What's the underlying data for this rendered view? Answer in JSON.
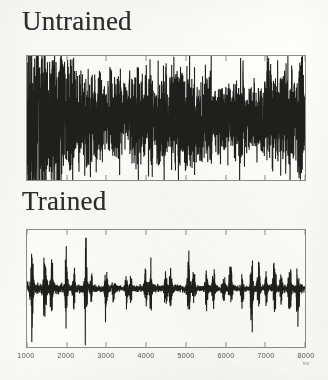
{
  "figure": {
    "background_color": "#fdfdfc",
    "trace_color": "#1f1f1d",
    "axis_color": "#8d8d8a"
  },
  "panels": [
    {
      "key": "untrained",
      "title": "Untrained",
      "description": "dense continuous high-amplitude activity across the whole record"
    },
    {
      "key": "trained",
      "title": "Trained",
      "description": "quiet baseline punctuated by sparse large discrete bursts"
    }
  ],
  "xaxis": {
    "unit": "ms",
    "min": 1000,
    "max": 8000,
    "ticks": [
      1000,
      2000,
      3000,
      4000,
      5000,
      6000,
      7000,
      8000
    ],
    "tick_labels": [
      "1000",
      "2000",
      "3000",
      "4000",
      "5000",
      "6000",
      "7000",
      "8000"
    ]
  },
  "chart_data": {
    "type": "line",
    "title": "",
    "xlabel": "ms",
    "ylabel": "",
    "xlim": [
      1000,
      8000
    ],
    "grid": false,
    "legend": "none",
    "series": [
      {
        "name": "Untrained",
        "panel": "untrained",
        "baseline": 0,
        "envelope_mean": 0.3,
        "envelope_peak": 1.0,
        "character": "continuous dense noise, near-constant activity, many overlapping medium spikes",
        "burst_times": [
          1060,
          1180,
          1290,
          1420,
          1560,
          1700,
          1850,
          2010,
          2150,
          2320,
          2480,
          2640,
          2810,
          2980,
          3140,
          3300,
          3470,
          3630,
          3800,
          3960,
          4120,
          4290,
          4450,
          4620,
          4780,
          4940,
          5110,
          5270,
          5440,
          5600,
          5760,
          5930,
          6090,
          6260,
          6420,
          6580,
          6750,
          6910,
          7080,
          7240,
          7400,
          7570,
          7730,
          7890
        ],
        "burst_amplitudes": [
          0.92,
          0.48,
          0.72,
          0.86,
          0.55,
          0.63,
          0.95,
          0.52,
          0.7,
          0.45,
          0.61,
          0.58,
          0.79,
          0.44,
          0.66,
          0.9,
          0.5,
          0.62,
          0.75,
          0.47,
          0.83,
          0.56,
          0.68,
          0.43,
          0.77,
          0.59,
          0.88,
          0.51,
          0.64,
          0.73,
          0.46,
          0.81,
          0.57,
          0.69,
          0.93,
          0.49,
          0.65,
          0.6,
          1.0,
          0.54,
          0.74,
          0.67,
          0.53,
          0.71
        ]
      },
      {
        "name": "Trained",
        "panel": "trained",
        "baseline": 0,
        "envelope_mean": 0.1,
        "envelope_peak": 1.0,
        "character": "low flat baseline with isolated tall narrow bursts",
        "burst_times": [
          1120,
          1450,
          1620,
          1990,
          2180,
          2480,
          2620,
          2990,
          3180,
          3520,
          3620,
          3990,
          4120,
          4500,
          4620,
          5070,
          5200,
          5520,
          5700,
          5950,
          6130,
          6420,
          6660,
          6830,
          7020,
          7230,
          7400,
          7620,
          7820
        ],
        "burst_amplitudes": [
          0.55,
          0.82,
          0.4,
          0.66,
          0.35,
          0.88,
          0.3,
          0.7,
          0.33,
          0.52,
          0.28,
          0.48,
          0.45,
          0.38,
          0.42,
          0.74,
          0.31,
          0.36,
          0.44,
          0.29,
          0.96,
          0.37,
          0.9,
          0.78,
          0.34,
          0.72,
          0.4,
          0.68,
          0.58
        ]
      }
    ]
  }
}
